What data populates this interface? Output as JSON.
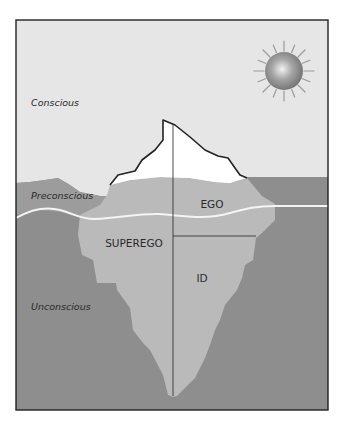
{
  "diagram": {
    "levels": [
      {
        "id": "conscious",
        "label": "Conscious"
      },
      {
        "id": "preconscious",
        "label": "Preconscious"
      },
      {
        "id": "unconscious",
        "label": "Unconscious"
      }
    ],
    "parts": [
      {
        "id": "ego",
        "label": "EGO"
      },
      {
        "id": "superego",
        "label": "SUPEREGO"
      },
      {
        "id": "id",
        "label": "ID"
      }
    ],
    "icons": {
      "sun": "sun-icon"
    },
    "colors": {
      "sky": "#e6e6e6",
      "water": "#8e8e8e",
      "preconscious_band": "#9c9c9c",
      "iceberg_above": "#ffffff",
      "iceberg_below": "#bababa",
      "waterline": "#f4f4f4",
      "outline": "#222222"
    }
  }
}
